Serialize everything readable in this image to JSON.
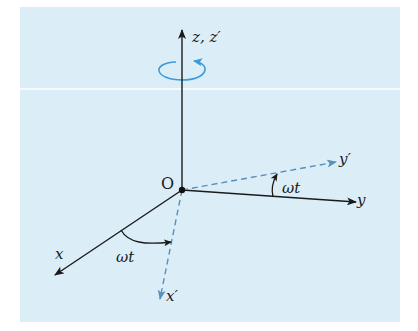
{
  "figure": {
    "background_color": "#dbeef8",
    "axis_color": "#1a1a1a",
    "rotated_axis_color": "#5b8fb9",
    "rotation_arrow_color": "#3d9ad6",
    "origin_label": "O",
    "axes": {
      "z": {
        "label": "z, z′",
        "style": "solid"
      },
      "x": {
        "label": "x",
        "style": "solid"
      },
      "y": {
        "label": "y",
        "style": "solid"
      },
      "x_prime": {
        "label": "x′",
        "style": "dashed"
      },
      "y_prime": {
        "label": "y′",
        "style": "dashed"
      }
    },
    "angles": [
      {
        "id": "angle-x-xprime",
        "label": "ωt"
      },
      {
        "id": "angle-y-yprime",
        "label": "ωt"
      }
    ],
    "rotation_indicator": "counter-clockwise rotation about z-axis"
  }
}
